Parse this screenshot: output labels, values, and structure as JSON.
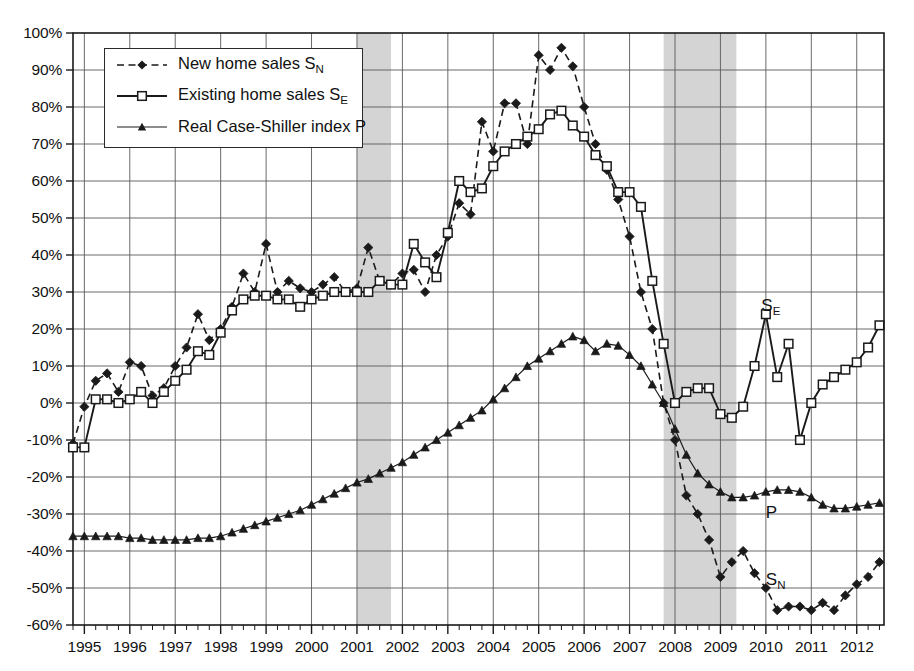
{
  "chart_data": {
    "type": "line",
    "title": "",
    "xlabel": "",
    "ylabel": "",
    "xlim": [
      1994.75,
      2012.6
    ],
    "ylim": [
      -60,
      100
    ],
    "ytick_step": 10,
    "grid": true,
    "legend_position": "top-left",
    "ytick_labels": [
      "100%",
      "90%",
      "80%",
      "70%",
      "60%",
      "50%",
      "40%",
      "30%",
      "20%",
      "10%",
      "0%",
      "-10%",
      "-20%",
      "-30%",
      "-40%",
      "-50%",
      "-60%"
    ],
    "ytick_values": [
      100,
      90,
      80,
      70,
      60,
      50,
      40,
      30,
      20,
      10,
      0,
      -10,
      -20,
      -30,
      -40,
      -50,
      -60
    ],
    "xtick_labels": [
      "1995",
      "1996",
      "1997",
      "1998",
      "1999",
      "2000",
      "2001",
      "2002",
      "2003",
      "2004",
      "2005",
      "2006",
      "2007",
      "2008",
      "2009",
      "2010",
      "2011",
      "2012"
    ],
    "xtick_values": [
      1995,
      1996,
      1997,
      1998,
      1999,
      2000,
      2001,
      2002,
      2003,
      2004,
      2005,
      2006,
      2007,
      2008,
      2009,
      2010,
      2011,
      2012
    ],
    "minor_ticks_per_year": 4,
    "shaded_regions": [
      {
        "name": "recession-2001",
        "start": 2001.0,
        "end": 2001.75,
        "color": "#d4d4d4"
      },
      {
        "name": "recession-2008",
        "start": 2007.75,
        "end": 2009.35,
        "color": "#d4d4d4"
      }
    ],
    "series": [
      {
        "name": "New home sales S_N",
        "key": "SN",
        "label_html": "New home sales S<sub>N</sub>",
        "annotation": "S_N",
        "style": "dashed",
        "marker": "diamond",
        "color": "#1a1a1a",
        "x": [
          1994.75,
          1995.0,
          1995.25,
          1995.5,
          1995.75,
          1996.0,
          1996.25,
          1996.5,
          1996.75,
          1997.0,
          1997.25,
          1997.5,
          1997.75,
          1998.0,
          1998.25,
          1998.5,
          1998.75,
          1999.0,
          1999.25,
          1999.5,
          1999.75,
          2000.0,
          2000.25,
          2000.5,
          2000.75,
          2001.0,
          2001.25,
          2001.5,
          2001.75,
          2002.0,
          2002.25,
          2002.5,
          2002.75,
          2003.0,
          2003.25,
          2003.5,
          2003.75,
          2004.0,
          2004.25,
          2004.5,
          2004.75,
          2005.0,
          2005.25,
          2005.5,
          2005.75,
          2006.0,
          2006.25,
          2006.5,
          2006.75,
          2007.0,
          2007.25,
          2007.5,
          2007.75,
          2008.0,
          2008.25,
          2008.5,
          2008.75,
          2009.0,
          2009.25,
          2009.5,
          2009.75,
          2010.0,
          2010.25,
          2010.5,
          2010.75,
          2011.0,
          2011.25,
          2011.5,
          2011.75,
          2012.0,
          2012.25,
          2012.5
        ],
        "y": [
          -11,
          -1,
          6,
          8,
          3,
          11,
          10,
          2,
          4,
          10,
          15,
          24,
          17,
          20,
          26,
          35,
          30,
          43,
          30,
          33,
          31,
          30,
          32,
          34,
          30,
          31,
          42,
          33,
          32,
          35,
          36,
          30,
          40,
          45,
          54,
          51,
          76,
          68,
          81,
          81,
          70,
          94,
          90,
          96,
          91,
          80,
          70,
          63,
          55,
          45,
          30,
          20,
          0,
          -10,
          -25,
          -30,
          -37,
          -47,
          -43,
          -40,
          -46,
          -50,
          -56,
          -55,
          -55,
          -56,
          -54,
          -56,
          -52,
          -49,
          -47,
          -43
        ]
      },
      {
        "name": "Existing home sales S_E",
        "key": "SE",
        "label_html": "Existing home sales S<sub>E</sub>",
        "annotation": "S_E",
        "style": "solid",
        "marker": "square-open",
        "color": "#1a1a1a",
        "x": [
          1994.75,
          1995.0,
          1995.25,
          1995.5,
          1995.75,
          1996.0,
          1996.25,
          1996.5,
          1996.75,
          1997.0,
          1997.25,
          1997.5,
          1997.75,
          1998.0,
          1998.25,
          1998.5,
          1998.75,
          1999.0,
          1999.25,
          1999.5,
          1999.75,
          2000.0,
          2000.25,
          2000.5,
          2000.75,
          2001.0,
          2001.25,
          2001.5,
          2001.75,
          2002.0,
          2002.25,
          2002.5,
          2002.75,
          2003.0,
          2003.25,
          2003.5,
          2003.75,
          2004.0,
          2004.25,
          2004.5,
          2004.75,
          2005.0,
          2005.25,
          2005.5,
          2005.75,
          2006.0,
          2006.25,
          2006.5,
          2006.75,
          2007.0,
          2007.25,
          2007.5,
          2007.75,
          2008.0,
          2008.25,
          2008.5,
          2008.75,
          2009.0,
          2009.25,
          2009.5,
          2009.75,
          2010.0,
          2010.25,
          2010.5,
          2010.75,
          2011.0,
          2011.25,
          2011.5,
          2011.75,
          2012.0,
          2012.25,
          2012.5
        ],
        "y": [
          -12,
          -12,
          1,
          1,
          0,
          1,
          3,
          0,
          3,
          6,
          9,
          14,
          13,
          19,
          25,
          28,
          29,
          29,
          28,
          28,
          26,
          28,
          29,
          30,
          30,
          30,
          30,
          33,
          32,
          32,
          43,
          38,
          34,
          46,
          60,
          57,
          58,
          64,
          68,
          70,
          72,
          74,
          78,
          79,
          75,
          72,
          67,
          64,
          57,
          57,
          53,
          33,
          16,
          0,
          3,
          4,
          4,
          -3,
          -4,
          -1,
          10,
          24,
          7,
          16,
          -10,
          0,
          5,
          7,
          9,
          11,
          15,
          21
        ]
      },
      {
        "name": "Real Case-Shiller index P",
        "key": "P",
        "label_html": "Real Case-Shiller index P",
        "annotation": "P",
        "style": "solid-thin",
        "marker": "triangle",
        "color": "#1a1a1a",
        "x": [
          1994.75,
          1995.0,
          1995.25,
          1995.5,
          1995.75,
          1996.0,
          1996.25,
          1996.5,
          1996.75,
          1997.0,
          1997.25,
          1997.5,
          1997.75,
          1998.0,
          1998.25,
          1998.5,
          1998.75,
          1999.0,
          1999.25,
          1999.5,
          1999.75,
          2000.0,
          2000.25,
          2000.5,
          2000.75,
          2001.0,
          2001.25,
          2001.5,
          2001.75,
          2002.0,
          2002.25,
          2002.5,
          2002.75,
          2003.0,
          2003.25,
          2003.5,
          2003.75,
          2004.0,
          2004.25,
          2004.5,
          2004.75,
          2005.0,
          2005.25,
          2005.5,
          2005.75,
          2006.0,
          2006.25,
          2006.5,
          2006.75,
          2007.0,
          2007.25,
          2007.5,
          2007.75,
          2008.0,
          2008.25,
          2008.5,
          2008.75,
          2009.0,
          2009.25,
          2009.5,
          2009.75,
          2010.0,
          2010.25,
          2010.5,
          2010.75,
          2011.0,
          2011.25,
          2011.5,
          2011.75,
          2012.0,
          2012.25,
          2012.5
        ],
        "y": [
          -36,
          -36,
          -36,
          -36,
          -36,
          -36.5,
          -36.5,
          -37,
          -37,
          -37,
          -37,
          -36.5,
          -36.5,
          -36,
          -35,
          -34,
          -33,
          -32,
          -31,
          -30,
          -29,
          -27.5,
          -26,
          -24.5,
          -23,
          -21.5,
          -20.5,
          -19,
          -17.5,
          -16,
          -14,
          -12,
          -10,
          -8,
          -6,
          -4,
          -2,
          1,
          4,
          7,
          10,
          12,
          14,
          16,
          18,
          17,
          14,
          16,
          15.5,
          13,
          10,
          5,
          0,
          -7,
          -14,
          -19,
          -22,
          -24,
          -25.5,
          -25.5,
          -25,
          -24,
          -23.5,
          -23.5,
          -24,
          -25.5,
          -27.5,
          -28.5,
          -28.5,
          -28,
          -27.5,
          -27
        ]
      }
    ],
    "annotations": [
      {
        "name": "annot-se",
        "text": "S",
        "sub": "E",
        "x": 2009.9,
        "y": 26
      },
      {
        "name": "annot-p",
        "text": "P",
        "sub": "",
        "x": 2010.0,
        "y": -30
      },
      {
        "name": "annot-sn",
        "text": "S",
        "sub": "N",
        "x": 2010.0,
        "y": -48
      }
    ]
  },
  "legend": {
    "items": [
      {
        "label": "New home sales S",
        "sub": "N",
        "key": "SN"
      },
      {
        "label": "Existing home sales S",
        "sub": "E",
        "key": "SE"
      },
      {
        "label": "Real Case-Shiller index P",
        "sub": "",
        "key": "P"
      }
    ]
  }
}
